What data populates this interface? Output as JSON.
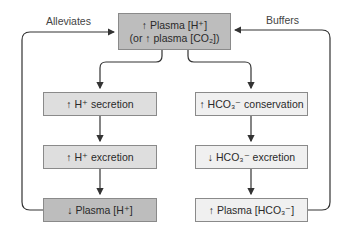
{
  "diagram": {
    "top_box": {
      "line1": "↑ Plasma [H⁺]",
      "line2": "(or ↑ plasma [CO₂])"
    },
    "left_chain": [
      {
        "label": "↑ H⁺ secretion"
      },
      {
        "label": "↑ H⁺ excretion"
      },
      {
        "label": "↓ Plasma [H⁺]"
      }
    ],
    "right_chain": [
      {
        "label": "↑ HCO₃⁻ conservation"
      },
      {
        "label": "↓ HCO₃⁻ excretion"
      },
      {
        "label": "↑ Plasma [HCO₃⁻]"
      }
    ],
    "feedback_labels": {
      "left": "Alleviates",
      "right": "Buffers"
    },
    "colors": {
      "dark_box": "#bdbdbd",
      "mid_box": "#dedede",
      "light_box": "#f0f0f0",
      "line": "#333333"
    }
  }
}
